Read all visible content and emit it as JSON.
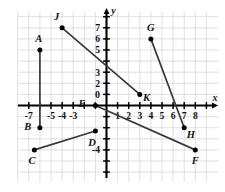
{
  "figure": {
    "background_color": "#ffffff",
    "grid_color": "#d8d8dc",
    "axis_color": "#000000",
    "point_color": "#000000",
    "segment_color": "#3a3a3a"
  },
  "chart_data": {
    "type": "scatter",
    "title": "",
    "xlabel": "x",
    "ylabel": "y",
    "xlim": [
      -8,
      9
    ],
    "ylim": [
      -6,
      8
    ],
    "grid": true,
    "legend": "none",
    "origin_label": "0",
    "xticks": [
      -7,
      -5,
      -4,
      -3,
      1,
      2,
      3,
      4,
      5,
      6,
      7,
      8
    ],
    "xtick_labels": [
      "-7",
      "-5",
      "-4",
      "-3",
      "1",
      "2",
      "3",
      "4",
      "5",
      "6",
      "7",
      "8"
    ],
    "yticks": [
      7,
      6,
      5,
      3,
      2,
      -4
    ],
    "ytick_labels": [
      "7",
      "6",
      "5",
      "3",
      "2",
      "-4"
    ],
    "points": [
      {
        "name": "A",
        "x": -6,
        "y": 5,
        "label": "A",
        "label_dx": -0.1,
        "label_dy": 1.0
      },
      {
        "name": "B",
        "x": -6,
        "y": -2,
        "label": "B",
        "label_dx": -1.1,
        "label_dy": 0.1
      },
      {
        "name": "C",
        "x": -6.5,
        "y": -4,
        "label": "C",
        "label_dx": -0.2,
        "label_dy": -1.0
      },
      {
        "name": "D",
        "x": -1,
        "y": -2.3,
        "label": "D",
        "label_dx": -0.3,
        "label_dy": -1.0
      },
      {
        "name": "E",
        "x": -1,
        "y": 0,
        "label": "E",
        "label_dx": -1.2,
        "label_dy": 0.15
      },
      {
        "name": "F",
        "x": 8,
        "y": -4,
        "label": "F",
        "label_dx": 0.0,
        "label_dy": -1.0
      },
      {
        "name": "G",
        "x": 4,
        "y": 6,
        "label": "G",
        "label_dx": 0.0,
        "label_dy": 1.0
      },
      {
        "name": "H",
        "x": 7,
        "y": -2,
        "label": "H",
        "label_dx": 0.6,
        "label_dy": -0.6
      },
      {
        "name": "J",
        "x": -4,
        "y": 7,
        "label": "J",
        "label_dx": -0.5,
        "label_dy": 1.0
      },
      {
        "name": "K",
        "x": 3,
        "y": 1,
        "label": "K",
        "label_dx": 0.6,
        "label_dy": -0.25
      }
    ],
    "segments": [
      {
        "name": "AB",
        "from": "A",
        "to": "B"
      },
      {
        "name": "CD",
        "from": "C",
        "to": "D"
      },
      {
        "name": "EF",
        "from": "E",
        "to": "F"
      },
      {
        "name": "GH",
        "from": "G",
        "to": "H"
      },
      {
        "name": "JK",
        "from": "J",
        "to": "K"
      }
    ]
  }
}
